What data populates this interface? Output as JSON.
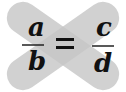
{
  "diagram": {
    "left_fraction": {
      "numerator": "a",
      "denominator": "b"
    },
    "right_fraction": {
      "numerator": "c",
      "denominator": "d"
    },
    "operator": "=",
    "colors": {
      "capsule": "#c6c6c6",
      "overlap": "#a9a9a9",
      "text": "#111111",
      "background": "#ffffff"
    }
  }
}
